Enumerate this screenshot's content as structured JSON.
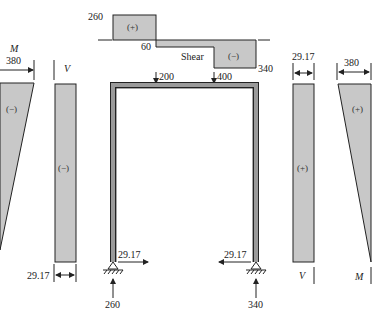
{
  "shear_diagram_top": {
    "title": "Shear",
    "values": {
      "left_top": "260",
      "step": "60",
      "right_bottom": "340"
    },
    "signs": {
      "positive": "(+)",
      "negative": "(−)"
    }
  },
  "loads": {
    "p1": "200",
    "p2": "400"
  },
  "supports": {
    "left": {
      "vertical": "260",
      "horizontal": "29.17"
    },
    "right": {
      "vertical": "340",
      "horizontal": "29.17"
    }
  },
  "left_column": {
    "moment": {
      "label": "M",
      "value": "380",
      "sign": "(−)"
    },
    "shear": {
      "label": "V",
      "value": "29.17",
      "sign": "(−)"
    }
  },
  "right_column": {
    "shear": {
      "label": "V",
      "value": "29.17",
      "sign": "(+)"
    },
    "moment": {
      "label": "M",
      "value": "380",
      "sign": "(+)"
    }
  },
  "colors": {
    "fill": "#c8c8c8",
    "stroke": "#222222",
    "frame": "#9a9a9a"
  }
}
